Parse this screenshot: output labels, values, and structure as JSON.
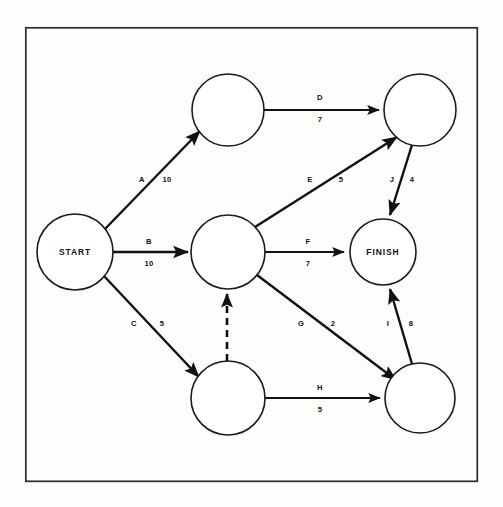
{
  "figure": {
    "type": "activity-on-arrow-network-diagram",
    "frame": {
      "x": 25,
      "y": 27,
      "width": 453,
      "height": 455,
      "color": "#2b2b2b"
    },
    "canvas": {
      "width": 503,
      "height": 507,
      "background": "#fdfdfc"
    },
    "line_color": "#111111",
    "node_fill": "#ffffff"
  },
  "nodes": [
    {
      "id": "start",
      "label": "START",
      "cx": 75,
      "cy": 252,
      "r": 38
    },
    {
      "id": "n2",
      "label": "",
      "cx": 228,
      "cy": 110,
      "r": 36
    },
    {
      "id": "n3",
      "label": "",
      "cx": 228,
      "cy": 252,
      "r": 37
    },
    {
      "id": "n4",
      "label": "",
      "cx": 228,
      "cy": 398,
      "r": 37
    },
    {
      "id": "n5",
      "label": "",
      "cx": 420,
      "cy": 110,
      "r": 36
    },
    {
      "id": "finish",
      "label": "FINISH",
      "cx": 383,
      "cy": 252,
      "r": 33
    },
    {
      "id": "n7",
      "label": "",
      "cx": 420,
      "cy": 398,
      "r": 35
    }
  ],
  "edges": [
    {
      "id": "A",
      "activity": "A",
      "duration": "10",
      "from": "start",
      "to": "n2",
      "style": "solid",
      "label_pos": {
        "x": 142,
        "y": 180
      },
      "duration_pos": {
        "x": 167,
        "y": 180
      }
    },
    {
      "id": "B",
      "activity": "B",
      "duration": "10",
      "from": "start",
      "to": "n3",
      "style": "solid",
      "label_pos": {
        "x": 149,
        "y": 242
      },
      "duration_pos": {
        "x": 149,
        "y": 264
      }
    },
    {
      "id": "C",
      "activity": "C",
      "duration": "5",
      "from": "start",
      "to": "n4",
      "style": "solid",
      "label_pos": {
        "x": 134,
        "y": 324
      },
      "duration_pos": {
        "x": 162,
        "y": 324
      }
    },
    {
      "id": "D",
      "activity": "D",
      "duration": "7",
      "from": "n2",
      "to": "n5",
      "style": "solid",
      "label_pos": {
        "x": 320,
        "y": 98
      },
      "duration_pos": {
        "x": 320,
        "y": 120
      }
    },
    {
      "id": "E",
      "activity": "E",
      "duration": "5",
      "from": "n3",
      "to": "n5",
      "style": "solid",
      "label_pos": {
        "x": 310,
        "y": 180
      },
      "duration_pos": {
        "x": 341,
        "y": 180
      }
    },
    {
      "id": "F",
      "activity": "F",
      "duration": "7",
      "from": "n3",
      "to": "finish",
      "style": "solid",
      "label_pos": {
        "x": 308,
        "y": 242
      },
      "duration_pos": {
        "x": 308,
        "y": 264
      }
    },
    {
      "id": "G",
      "activity": "G",
      "duration": "2",
      "from": "n3",
      "to": "n7",
      "style": "solid",
      "label_pos": {
        "x": 301,
        "y": 324
      },
      "duration_pos": {
        "x": 333,
        "y": 324
      }
    },
    {
      "id": "H",
      "activity": "H",
      "duration": "5",
      "from": "n4",
      "to": "n7",
      "style": "solid",
      "label_pos": {
        "x": 320,
        "y": 388
      },
      "duration_pos": {
        "x": 320,
        "y": 410
      }
    },
    {
      "id": "I",
      "activity": "I",
      "duration": "8",
      "from": "n7",
      "to": "finish",
      "style": "solid",
      "label_pos": {
        "x": 388,
        "y": 324
      },
      "duration_pos": {
        "x": 411,
        "y": 324
      }
    },
    {
      "id": "J",
      "activity": "J",
      "duration": "4",
      "from": "n5",
      "to": "finish",
      "style": "solid",
      "label_pos": {
        "x": 392,
        "y": 180
      },
      "duration_pos": {
        "x": 412,
        "y": 180
      }
    },
    {
      "id": "dummy",
      "activity": "",
      "duration": "",
      "from": "n4",
      "to": "n3",
      "style": "dashed",
      "label_pos": null,
      "duration_pos": null
    }
  ]
}
